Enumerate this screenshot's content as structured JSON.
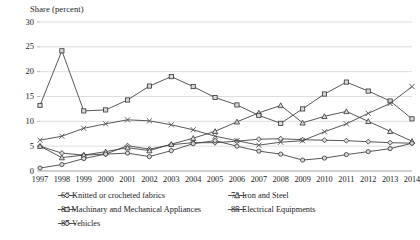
{
  "chart_data": {
    "type": "line",
    "title": "",
    "ylabel": "Share (percent)",
    "xlabel": "",
    "ylim": [
      0,
      30
    ],
    "yticks": [
      0,
      5,
      10,
      15,
      20,
      25,
      30
    ],
    "grid": true,
    "legend_position": "bottom",
    "categories": [
      "1997",
      "1998",
      "1999",
      "2000",
      "2001",
      "2002",
      "2003",
      "2004",
      "2005",
      "2006",
      "2007",
      "2008",
      "2009",
      "2010",
      "2011",
      "2012",
      "2013",
      "2014"
    ],
    "series": [
      {
        "name": "60-Knitted or crocheted fabrics",
        "marker": "diamond",
        "values": [
          5.0,
          3.6,
          3.2,
          3.4,
          5.1,
          4.4,
          5.3,
          5.7,
          5.7,
          6.0,
          6.4,
          6.5,
          6.3,
          6.2,
          6.1,
          5.9,
          5.7,
          5.6
        ]
      },
      {
        "name": "72-Iron and Steel",
        "marker": "triangle",
        "values": [
          5.0,
          2.7,
          3.2,
          3.9,
          4.7,
          4.1,
          5.4,
          6.6,
          8.0,
          9.9,
          11.7,
          13.2,
          9.7,
          11.0,
          12.0,
          10.0,
          8.0,
          6.0
        ]
      },
      {
        "name": "84 Machinary and Mechanical Appliances",
        "marker": "square",
        "values": [
          13.2,
          24.2,
          12.1,
          12.3,
          14.3,
          17.1,
          19.0,
          17.0,
          14.8,
          13.3,
          11.2,
          9.6,
          12.5,
          15.5,
          17.9,
          16.1,
          14.1,
          10.5
        ]
      },
      {
        "name": "85-Electrical Equipments",
        "marker": "x",
        "values": [
          6.2,
          7.0,
          8.6,
          9.5,
          10.3,
          10.1,
          9.3,
          8.3,
          7.0,
          6.1,
          5.2,
          5.8,
          6.1,
          7.9,
          9.5,
          11.6,
          13.6,
          17.0
        ]
      },
      {
        "name": "87-Vehicles",
        "marker": "circle",
        "values": [
          0.6,
          1.3,
          2.5,
          3.4,
          3.6,
          2.9,
          4.1,
          5.5,
          6.1,
          5.0,
          4.0,
          3.4,
          2.2,
          2.6,
          3.3,
          3.9,
          4.5,
          5.6
        ]
      }
    ]
  },
  "axis": {
    "ylabel": "Share (percent)"
  },
  "legend": [
    {
      "label": "60-Knitted or crocheted fabrics",
      "marker": "diamond"
    },
    {
      "label": "72-Iron and Steel",
      "marker": "triangle"
    },
    {
      "label": "84 Machinary and Mechanical Appliances",
      "marker": "square"
    },
    {
      "label": "85-Electrical Equipments",
      "marker": "x"
    },
    {
      "label": "87-Vehicles",
      "marker": "circle"
    }
  ]
}
